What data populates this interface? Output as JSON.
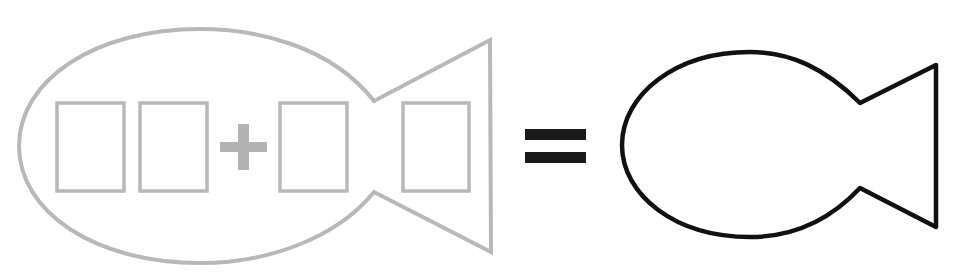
{
  "diagram": {
    "colors": {
      "background": "#ffffff",
      "left_fish_stroke": "#b8b8b8",
      "plus_sign": "#b3b3b3",
      "equals_sign": "#1a1a1a",
      "right_fish_stroke": "#111111"
    },
    "left_fish": {
      "boxes": [
        {
          "id": "box-1",
          "value": ""
        },
        {
          "id": "box-2",
          "value": ""
        },
        {
          "id": "box-3",
          "value": ""
        },
        {
          "id": "box-4",
          "value": ""
        }
      ],
      "operator": "+"
    },
    "equals": "=",
    "right_fish": {
      "value": ""
    }
  }
}
